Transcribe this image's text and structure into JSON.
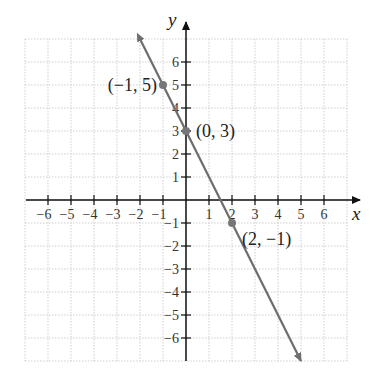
{
  "chart_data": {
    "type": "line",
    "title": "",
    "xlabel": "x",
    "ylabel": "y",
    "xlim": [
      -7,
      7
    ],
    "ylim": [
      -7,
      7
    ],
    "grid": true,
    "x_ticks": [
      -6,
      -5,
      -4,
      -3,
      -2,
      -1,
      1,
      2,
      3,
      4,
      5,
      6
    ],
    "y_ticks": [
      -6,
      -5,
      -4,
      -3,
      -2,
      -1,
      1,
      2,
      3,
      4,
      5,
      6
    ],
    "series": [
      {
        "name": "y = -2x + 3",
        "x": [
          -2,
          5
        ],
        "y": [
          7,
          -7
        ],
        "color": "#6e6e6e",
        "arrows": "both"
      }
    ],
    "points": [
      {
        "x": -1,
        "y": 5,
        "label": "(−1, 5)"
      },
      {
        "x": 0,
        "y": 3,
        "label": "(0, 3)"
      },
      {
        "x": 2,
        "y": -1,
        "label": "(2, −1)"
      }
    ]
  }
}
